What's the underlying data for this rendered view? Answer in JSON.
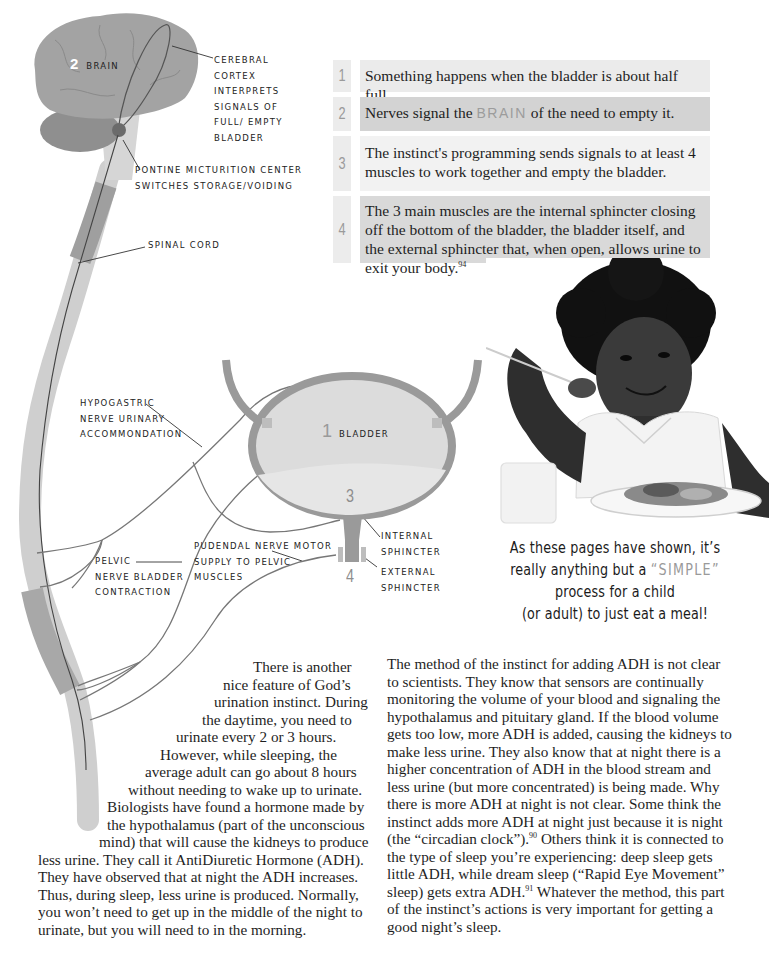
{
  "diagram": {
    "brain_label": {
      "number": "2",
      "text": "Brain"
    },
    "cerebral_cortex": [
      "Cerebral",
      "cortex",
      "interprets",
      "signals of",
      "full/ empty",
      "bladder"
    ],
    "pontine": [
      "Pontine micturition center",
      "switches storage/voiding"
    ],
    "spinal_cord": "Spinal cord",
    "hypogastric": [
      "Hypogastric",
      "nerve urinary",
      "accommondation"
    ],
    "pelvic": [
      "Pelvic",
      "nerve bladder",
      "contraction"
    ],
    "pudendal": [
      "Pudendal nerve motor",
      "supply to pelvic",
      "muscles"
    ],
    "bladder_label": {
      "number": "1",
      "text": "Bladder"
    },
    "bladder_number_3": "3",
    "sphincter_number_4": "4",
    "internal_sphincter": [
      "Internal",
      "sphincter"
    ],
    "external_sphincter": [
      "External",
      "sphincter"
    ]
  },
  "steps": [
    {
      "number": "1",
      "text": "Something happens when the bladder is about half full."
    },
    {
      "number": "2",
      "text_before": "Nerves signal the ",
      "highlight": "BRAIN",
      "text_after": " of the need to empty it."
    },
    {
      "number": "3",
      "text": "The instinct's programming sends signals to at least 4 muscles to work together and empty the bladder."
    },
    {
      "number": "4",
      "text": "The 3 main muscles are the internal sphincter closing off the bottom of the bladder, the bladder itself, and the external sphincter that, when open, allows urine to exit your body.",
      "footnote": "94"
    }
  ],
  "photo": {
    "alt": "Smiling child with afro hair eating a meal with a fork at a table"
  },
  "caption": {
    "line1": "As these pages have shown, it’s",
    "line2_before": "really anything but a ",
    "line2_highlight": "“SIMPLE”",
    "line3": "process for a child",
    "line4": "(or adult) to just eat a meal!"
  },
  "left_column": {
    "lines": [
      {
        "text": "There is another",
        "indent": 215
      },
      {
        "text": "nice feature of God’s",
        "indent": 185
      },
      {
        "text": "urination instinct. During",
        "indent": 176
      },
      {
        "text": "the daytime, you need to",
        "indent": 164
      },
      {
        "text": "urinate every 2 or 3 hours.",
        "indent": 138
      },
      {
        "text": "However, while sleeping, the",
        "indent": 122
      },
      {
        "text": "average adult can go about 8 hours",
        "indent": 107
      },
      {
        "text": "without needing to wake up to urinate.",
        "indent": 90
      },
      {
        "text": "Biologists have found a hormone made by",
        "indent": 69
      },
      {
        "text": "the hypothalamus (part of the unconscious",
        "indent": 69
      },
      {
        "text": "mind) that will cause the kidneys to produce",
        "indent": 61
      },
      {
        "text": "less urine. They call it AntiDiuretic Hormone (ADH).",
        "indent": 0
      },
      {
        "text": "They have observed that at night the ADH increases.",
        "indent": 0
      },
      {
        "text": "Thus, during sleep, less urine is produced. Normally,",
        "indent": 0
      },
      {
        "text": "you won’t need to get up in the middle of the night to",
        "indent": 0
      },
      {
        "text": "urinate, but you will need to in the morning.",
        "indent": 0
      }
    ]
  },
  "right_column": {
    "part1": "The method of the instinct for adding ADH is not clear to scientists. They know that sensors are continually monitoring the volume of your blood and signaling the hypothalamus and pituitary gland. If the blood volume gets too low, more ADH is added, causing the kidneys to make less urine. They also know that at night there is a higher concentration of ADH in the blood stream and less urine (but more concentrated) is being made. Why there is more ADH at night is not clear. Some think the instinct adds more ADH at night just because it is night (the “circadian clock”).",
    "footnote1": "90",
    "part2": " Others think it is connected to the type of sleep you’re experiencing: deep sleep gets little ADH, while dream sleep (“Rapid Eye Movement” sleep) gets extra ADH.",
    "footnote2": "91",
    "part3": " Whatever the method, this part of the instinct’s actions is very important for getting a good night’s sleep."
  }
}
